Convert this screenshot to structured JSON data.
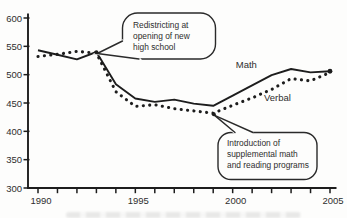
{
  "chart_data": {
    "type": "line",
    "title": "",
    "xlabel": "",
    "ylabel": "",
    "grid": false,
    "legend": "inline-labels",
    "x": [
      1990,
      1991,
      1992,
      1993,
      1994,
      1995,
      1996,
      1997,
      1998,
      1999,
      2000,
      2001,
      2002,
      2003,
      2004,
      2005
    ],
    "x_axis": {
      "range": [
        1990,
        2005
      ],
      "labeled_ticks": [
        1990,
        1995,
        2000,
        2005
      ]
    },
    "y_axis": {
      "range": [
        300,
        600
      ],
      "tick_step": 50,
      "ticks": [
        600,
        550,
        500,
        450,
        400,
        350,
        300
      ]
    },
    "series": [
      {
        "name": "Math",
        "style": "solid",
        "values": [
          543,
          535,
          527,
          540,
          483,
          458,
          452,
          456,
          449,
          445,
          463,
          481,
          499,
          510,
          504,
          506
        ],
        "label_anchor": {
          "year": 2000.7,
          "value": 511
        }
      },
      {
        "name": "Verbal",
        "style": "dotted",
        "values": [
          532,
          536,
          541,
          538,
          470,
          444,
          447,
          440,
          436,
          432,
          446,
          459,
          474,
          493,
          489,
          504
        ],
        "label_anchor": {
          "year": 2002.3,
          "value": 453
        }
      }
    ],
    "annotations": [
      {
        "text": "Redistricting at opening of new high school",
        "lines": [
          "Redistricting at",
          "opening of new",
          "high school"
        ],
        "target": {
          "year": 1993,
          "value": 540
        }
      },
      {
        "text": "Introduction of supplemental math and reading programs",
        "lines": [
          "Introduction of",
          "supplemental math",
          "and reading programs"
        ],
        "target": {
          "year": 1999,
          "value": 432
        }
      }
    ],
    "colors": {
      "line": "#1d1d1d",
      "text": "#2e2e2e",
      "bubble_stroke": "#2a2a2a",
      "background": "#fdfdfc"
    }
  }
}
